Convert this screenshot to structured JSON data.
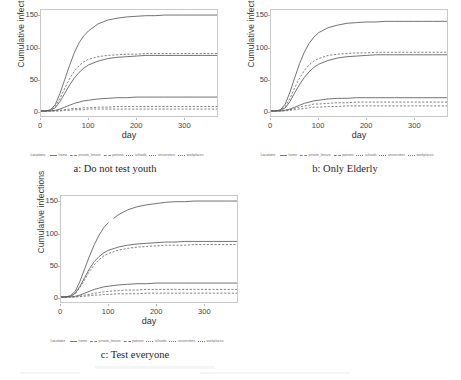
{
  "figure": {
    "panels": [
      {
        "id": "a",
        "caption": "a: Do not test youth",
        "chart_index": 0
      },
      {
        "id": "b",
        "caption": "b: Only Elderly",
        "chart_index": 1
      },
      {
        "id": "c",
        "caption": "c: Test everyone",
        "chart_index": 2
      }
    ],
    "legend": {
      "title": "Locations",
      "items": [
        {
          "label": "home",
          "style": "solid"
        },
        {
          "label": "private_leisure",
          "style": "dashed"
        },
        {
          "label": "patrons",
          "style": "dashed"
        },
        {
          "label": "schools",
          "style": "dotted"
        },
        {
          "label": "universities",
          "style": "dotted"
        },
        {
          "label": "workplaces",
          "style": "dotted"
        }
      ]
    }
  },
  "chart_data": [
    {
      "type": "line",
      "title": "a: Do not test youth",
      "xlabel": "day",
      "ylabel": "Cumulative infections",
      "xlim": [
        0,
        370
      ],
      "ylim": [
        -8,
        160
      ],
      "xticks": [
        0,
        100,
        200,
        300
      ],
      "yticks": [
        0,
        50,
        100,
        150
      ],
      "grid": false,
      "legend_position": "bottom",
      "x": [
        0,
        10,
        20,
        30,
        40,
        50,
        60,
        70,
        80,
        90,
        100,
        120,
        140,
        160,
        180,
        200,
        220,
        240,
        260,
        280,
        300,
        320,
        340,
        360,
        370
      ],
      "series": [
        {
          "name": "home",
          "style": "solid",
          "values": [
            0,
            0,
            2,
            10,
            28,
            50,
            72,
            92,
            108,
            119,
            127,
            138,
            144,
            147,
            149,
            150,
            151,
            151,
            152,
            152,
            152,
            152,
            152,
            152,
            152
          ]
        },
        {
          "name": "private_leisure",
          "style": "dashed",
          "values": [
            0,
            0,
            1,
            7,
            20,
            36,
            51,
            63,
            72,
            78,
            82,
            86,
            88,
            89,
            90,
            90,
            91,
            91,
            91,
            91,
            91,
            91,
            91,
            91,
            91
          ]
        },
        {
          "name": "patrons",
          "style": "solid",
          "values": [
            0,
            0,
            1,
            5,
            15,
            28,
            41,
            52,
            61,
            68,
            73,
            79,
            83,
            85,
            86,
            87,
            88,
            88,
            88,
            88,
            88,
            88,
            88,
            88,
            88
          ]
        },
        {
          "name": "schools",
          "style": "solid",
          "values": [
            0,
            0,
            0,
            1,
            3,
            6,
            9,
            12,
            14,
            16,
            17,
            19,
            20,
            21,
            21,
            22,
            22,
            22,
            22,
            22,
            22,
            22,
            22,
            22,
            22
          ]
        },
        {
          "name": "universities",
          "style": "dashed",
          "values": [
            0,
            0,
            0,
            0,
            1,
            2,
            3,
            4,
            4,
            5,
            5,
            6,
            6,
            7,
            7,
            7,
            7,
            7,
            7,
            7,
            7,
            7,
            7,
            7,
            7
          ]
        },
        {
          "name": "workplaces",
          "style": "dashed",
          "values": [
            0,
            0,
            0,
            0,
            0,
            1,
            1,
            2,
            2,
            2,
            3,
            3,
            3,
            3,
            3,
            3,
            3,
            3,
            3,
            3,
            3,
            3,
            3,
            3,
            3
          ]
        }
      ]
    },
    {
      "type": "line",
      "title": "b: Only Elderly",
      "xlabel": "day",
      "ylabel": "Cumulative infections",
      "xlim": [
        0,
        370
      ],
      "ylim": [
        -8,
        160
      ],
      "xticks": [
        0,
        100,
        200,
        300
      ],
      "yticks": [
        0,
        50,
        100,
        150
      ],
      "grid": false,
      "legend_position": "bottom",
      "x": [
        0,
        10,
        20,
        30,
        40,
        50,
        60,
        70,
        80,
        90,
        100,
        120,
        140,
        160,
        180,
        200,
        220,
        240,
        260,
        280,
        300,
        320,
        340,
        360,
        370
      ],
      "series": [
        {
          "name": "home",
          "style": "solid",
          "values": [
            0,
            0,
            2,
            11,
            30,
            53,
            75,
            93,
            107,
            117,
            124,
            132,
            136,
            139,
            140,
            141,
            141,
            142,
            142,
            142,
            142,
            142,
            142,
            142,
            142
          ]
        },
        {
          "name": "private_leisure",
          "style": "dashed",
          "values": [
            0,
            0,
            1,
            7,
            20,
            37,
            52,
            64,
            73,
            79,
            83,
            88,
            90,
            91,
            92,
            92,
            93,
            93,
            93,
            93,
            93,
            93,
            93,
            93,
            93
          ]
        },
        {
          "name": "patrons",
          "style": "solid",
          "values": [
            0,
            0,
            1,
            5,
            15,
            29,
            42,
            53,
            62,
            69,
            74,
            80,
            84,
            86,
            87,
            88,
            89,
            89,
            89,
            89,
            89,
            89,
            89,
            89,
            89
          ]
        },
        {
          "name": "schools",
          "style": "solid",
          "values": [
            0,
            0,
            0,
            1,
            3,
            6,
            9,
            12,
            14,
            16,
            17,
            19,
            20,
            20,
            21,
            21,
            21,
            21,
            21,
            21,
            21,
            21,
            21,
            21,
            21
          ]
        },
        {
          "name": "universities",
          "style": "dashed",
          "values": [
            0,
            0,
            0,
            1,
            2,
            4,
            6,
            8,
            9,
            11,
            11,
            12,
            13,
            13,
            14,
            14,
            14,
            14,
            14,
            14,
            14,
            14,
            14,
            14,
            14
          ]
        },
        {
          "name": "workplaces",
          "style": "dashed",
          "values": [
            0,
            0,
            0,
            0,
            1,
            2,
            3,
            4,
            5,
            6,
            6,
            7,
            7,
            8,
            8,
            8,
            8,
            8,
            8,
            8,
            8,
            8,
            8,
            8,
            8
          ]
        }
      ]
    },
    {
      "type": "line",
      "title": "c: Test everyone",
      "xlabel": "day",
      "ylabel": "Cumulative infections",
      "xlim": [
        0,
        370
      ],
      "ylim": [
        -8,
        160
      ],
      "xticks": [
        0,
        100,
        200,
        300
      ],
      "yticks": [
        0,
        50,
        100,
        150
      ],
      "grid": false,
      "legend_position": "bottom",
      "x": [
        0,
        10,
        20,
        30,
        40,
        50,
        60,
        70,
        80,
        90,
        100,
        120,
        140,
        160,
        180,
        200,
        220,
        240,
        260,
        280,
        300,
        320,
        340,
        360,
        370
      ],
      "series": [
        {
          "name": "home",
          "style": "solid",
          "values": [
            0,
            0,
            2,
            9,
            25,
            45,
            65,
            83,
            98,
            110,
            118,
            130,
            138,
            143,
            146,
            148,
            150,
            151,
            151,
            152,
            152,
            152,
            152,
            152,
            152
          ]
        },
        {
          "name": "private_leisure",
          "style": "solid",
          "values": [
            0,
            0,
            1,
            6,
            17,
            31,
            45,
            56,
            64,
            70,
            74,
            79,
            82,
            84,
            85,
            86,
            87,
            87,
            88,
            88,
            88,
            88,
            88,
            88,
            88
          ]
        },
        {
          "name": "patrons",
          "style": "dashed",
          "values": [
            0,
            0,
            1,
            5,
            15,
            28,
            41,
            51,
            59,
            65,
            69,
            74,
            77,
            79,
            80,
            81,
            82,
            82,
            82,
            83,
            83,
            83,
            83,
            83,
            83
          ]
        },
        {
          "name": "schools",
          "style": "solid",
          "values": [
            0,
            0,
            0,
            1,
            3,
            6,
            9,
            12,
            14,
            16,
            17,
            19,
            20,
            21,
            21,
            22,
            22,
            22,
            22,
            22,
            22,
            22,
            22,
            22,
            22
          ]
        },
        {
          "name": "universities",
          "style": "dashed",
          "values": [
            0,
            0,
            0,
            0,
            1,
            3,
            4,
            6,
            7,
            8,
            9,
            10,
            11,
            11,
            12,
            12,
            12,
            12,
            12,
            12,
            12,
            12,
            12,
            12,
            12
          ]
        },
        {
          "name": "workplaces",
          "style": "dashed",
          "values": [
            0,
            0,
            0,
            0,
            1,
            1,
            2,
            3,
            3,
            4,
            4,
            5,
            5,
            5,
            6,
            6,
            6,
            6,
            6,
            6,
            6,
            6,
            6,
            6,
            6
          ]
        }
      ]
    }
  ]
}
